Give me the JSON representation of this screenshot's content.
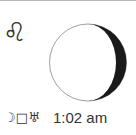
{
  "zodiac": {
    "sign": "Leo",
    "glyph": "♌"
  },
  "moon": {
    "phase": "waning gibbous",
    "shadow_side": "right",
    "lit_color": "#ffffff",
    "shadow_color": "#1a1a1a",
    "outline_color": "#999999"
  },
  "aspect": {
    "glyph": "☽□♅",
    "planet1": "Moon",
    "aspect_type": "Square",
    "planet2": "Uranus",
    "time": "1:02 am"
  }
}
